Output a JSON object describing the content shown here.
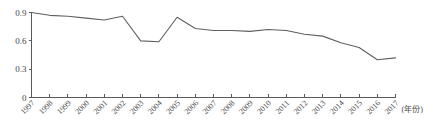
{
  "chart_data": {
    "type": "line",
    "title": "",
    "subtitle": "",
    "xlabel": "(年份)",
    "ylabel": "",
    "xlim": [
      1997,
      2017
    ],
    "ylim": [
      0,
      0.9
    ],
    "grid": false,
    "legend": false,
    "legend_position": "none",
    "y_ticks": [
      "0",
      "0.3",
      "0.6",
      "0.9"
    ],
    "y_tick_values": [
      0,
      0.3,
      0.6,
      0.9
    ],
    "categories": [
      "1997",
      "1998",
      "1999",
      "2000",
      "2001",
      "2002",
      "2003",
      "2004",
      "2005",
      "2006",
      "2007",
      "2008",
      "2009",
      "2010",
      "2011",
      "2012",
      "2013",
      "2014",
      "2015",
      "2016",
      "2017"
    ],
    "x": [
      1997,
      1998,
      1999,
      2000,
      2001,
      2002,
      2003,
      2004,
      2005,
      2006,
      2007,
      2008,
      2009,
      2010,
      2011,
      2012,
      2013,
      2014,
      2015,
      2016,
      2017
    ],
    "series": [
      {
        "name": "series-1",
        "values": [
          0.9,
          0.87,
          0.86,
          0.84,
          0.82,
          0.86,
          0.6,
          0.59,
          0.85,
          0.73,
          0.71,
          0.71,
          0.7,
          0.72,
          0.71,
          0.67,
          0.65,
          0.58,
          0.53,
          0.4,
          0.42
        ]
      }
    ],
    "values": [
      0.9,
      0.87,
      0.86,
      0.84,
      0.82,
      0.86,
      0.6,
      0.59,
      0.85,
      0.73,
      0.71,
      0.71,
      0.7,
      0.72,
      0.71,
      0.67,
      0.65,
      0.58,
      0.53,
      0.4,
      0.42
    ],
    "annotations": [],
    "colors": {
      "line": "#5f5f5f",
      "axis": "#5a5a5a",
      "text": "#4a4a4a",
      "background": "#ffffff"
    }
  }
}
